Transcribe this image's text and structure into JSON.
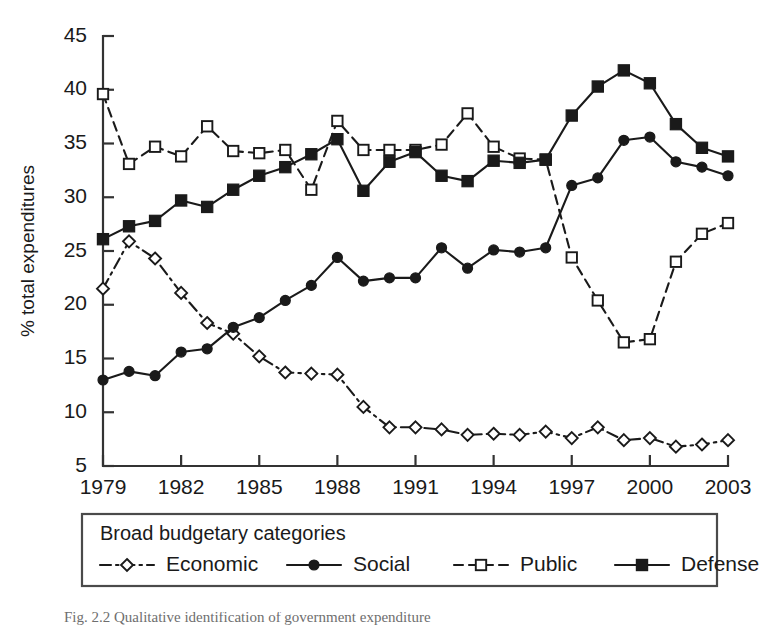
{
  "figure": {
    "background_color": "#ffffff",
    "ink_color": "#1a1a1a"
  },
  "axes": {
    "y_title": "% total expenditures",
    "y_ticks": [
      "5",
      "10",
      "15",
      "20",
      "25",
      "30",
      "35",
      "40",
      "45"
    ],
    "x_ticks": [
      "1979",
      "1982",
      "1985",
      "1988",
      "1991",
      "1994",
      "1997",
      "2000",
      "2003"
    ]
  },
  "legend": {
    "title": "Broad budgetary categories",
    "entries": [
      {
        "label": "Economic",
        "marker": "open-diamond",
        "dash": "dash-dot"
      },
      {
        "label": "Social",
        "marker": "filled-circle",
        "dash": "solid"
      },
      {
        "label": "Public",
        "marker": "open-square",
        "dash": "dashed"
      },
      {
        "label": "Defense",
        "marker": "filled-square",
        "dash": "solid"
      }
    ]
  },
  "caption": {
    "text": "Fig. 2.2  Qualitative identification of government expenditure"
  },
  "chart_data": {
    "type": "line",
    "title": "",
    "xlabel": "",
    "ylabel": "% total expenditures",
    "xlim": [
      1979,
      2003
    ],
    "ylim": [
      5,
      45
    ],
    "grid": false,
    "legend_position": "below-outside",
    "legend_title": "Broad budgetary categories",
    "x": [
      1979,
      1980,
      1981,
      1982,
      1983,
      1984,
      1985,
      1986,
      1987,
      1988,
      1989,
      1990,
      1991,
      1992,
      1993,
      1994,
      1995,
      1996,
      1997,
      1998,
      1999,
      2000,
      2001,
      2002,
      2003
    ],
    "series": [
      {
        "name": "Economic",
        "marker": "open-diamond",
        "dash": "dash-dot",
        "values": [
          21.5,
          25.9,
          24.3,
          21.1,
          18.3,
          17.3,
          15.2,
          13.7,
          13.6,
          13.5,
          10.5,
          8.6,
          8.6,
          8.4,
          7.9,
          8.0,
          7.9,
          8.2,
          7.6,
          8.6,
          7.4,
          7.6,
          6.8,
          7.0,
          7.4
        ]
      },
      {
        "name": "Social",
        "marker": "filled-circle",
        "dash": "solid",
        "values": [
          13.0,
          13.8,
          13.4,
          15.6,
          15.9,
          17.9,
          18.8,
          20.4,
          21.8,
          24.4,
          22.2,
          22.5,
          22.5,
          25.3,
          23.4,
          25.1,
          24.9,
          25.3,
          31.1,
          31.8,
          35.3,
          35.6,
          33.3,
          32.8,
          32.0
        ]
      },
      {
        "name": "Public",
        "marker": "open-square",
        "dash": "dashed",
        "values": [
          39.6,
          33.1,
          34.7,
          33.8,
          36.6,
          34.3,
          34.1,
          34.4,
          30.7,
          37.1,
          34.4,
          34.4,
          34.4,
          34.9,
          37.8,
          34.7,
          33.6,
          33.5,
          24.4,
          20.4,
          16.5,
          16.8,
          24.0,
          26.6,
          27.6
        ]
      },
      {
        "name": "Defense",
        "marker": "filled-square",
        "dash": "solid",
        "values": [
          26.1,
          27.3,
          27.8,
          29.7,
          29.1,
          30.7,
          32.0,
          32.8,
          34.0,
          35.4,
          30.6,
          33.3,
          34.2,
          32.0,
          31.5,
          33.4,
          33.2,
          33.5,
          37.6,
          40.3,
          41.8,
          40.6,
          36.8,
          34.6,
          33.8
        ]
      }
    ]
  }
}
